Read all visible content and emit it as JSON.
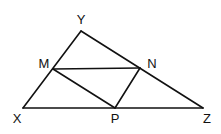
{
  "diagram": {
    "points": {
      "Y": {
        "label": "Y",
        "x": 81,
        "y": 31,
        "lx": 81,
        "ly": 24
      },
      "X": {
        "label": "X",
        "x": 23,
        "y": 108,
        "lx": 17,
        "ly": 123
      },
      "Z": {
        "label": "Z",
        "x": 203,
        "y": 108,
        "lx": 207,
        "ly": 123
      },
      "M": {
        "label": "M",
        "x": 53,
        "y": 69,
        "lx": 44,
        "ly": 68
      },
      "N": {
        "label": "N",
        "x": 140,
        "y": 68,
        "lx": 152,
        "ly": 68
      },
      "P": {
        "label": "P",
        "x": 115,
        "y": 108,
        "lx": 115,
        "ly": 123
      }
    },
    "segments": [
      [
        "X",
        "Y"
      ],
      [
        "Y",
        "Z"
      ],
      [
        "X",
        "Z"
      ],
      [
        "M",
        "N"
      ],
      [
        "M",
        "P"
      ],
      [
        "N",
        "P"
      ]
    ],
    "stroke_color": "#111111"
  }
}
